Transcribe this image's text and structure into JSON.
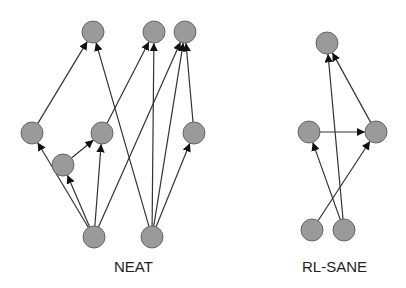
{
  "colors": {
    "node_fill": "#9a9a9a",
    "node_stroke": "#666666",
    "edge": "#333333",
    "arrow": "#111111"
  },
  "node_radius": 11,
  "diagrams": [
    {
      "label": "NEAT",
      "label_pos": [
        114,
        258
      ],
      "nodes": [
        {
          "id": "t1",
          "x": 93,
          "y": 32
        },
        {
          "id": "t2",
          "x": 154,
          "y": 32
        },
        {
          "id": "t3",
          "x": 185,
          "y": 32
        },
        {
          "id": "ml",
          "x": 32,
          "y": 133
        },
        {
          "id": "mm",
          "x": 102,
          "y": 133
        },
        {
          "id": "mr",
          "x": 194,
          "y": 133
        },
        {
          "id": "s",
          "x": 63,
          "y": 165
        },
        {
          "id": "b1",
          "x": 94,
          "y": 237
        },
        {
          "id": "b2",
          "x": 152,
          "y": 237
        }
      ],
      "edges": [
        [
          "ml",
          "t1"
        ],
        [
          "b2",
          "t1"
        ],
        [
          "mm",
          "t2"
        ],
        [
          "b2",
          "t2"
        ],
        [
          "b1",
          "t3"
        ],
        [
          "b2",
          "t3"
        ],
        [
          "mr",
          "t3"
        ],
        [
          "b1",
          "ml"
        ],
        [
          "b1",
          "s"
        ],
        [
          "s",
          "mm"
        ],
        [
          "b1",
          "mm"
        ],
        [
          "b2",
          "mr"
        ]
      ]
    },
    {
      "label": "RL-SANE",
      "label_pos": [
        302,
        258
      ],
      "nodes": [
        {
          "id": "t",
          "x": 327,
          "y": 43
        },
        {
          "id": "l",
          "x": 309,
          "y": 132
        },
        {
          "id": "r",
          "x": 376,
          "y": 132
        },
        {
          "id": "bl",
          "x": 312,
          "y": 230
        },
        {
          "id": "br",
          "x": 344,
          "y": 230
        }
      ],
      "edges": [
        [
          "l",
          "r"
        ],
        [
          "bl",
          "r"
        ],
        [
          "br",
          "l"
        ],
        [
          "br",
          "t"
        ],
        [
          "r",
          "t"
        ]
      ]
    }
  ]
}
